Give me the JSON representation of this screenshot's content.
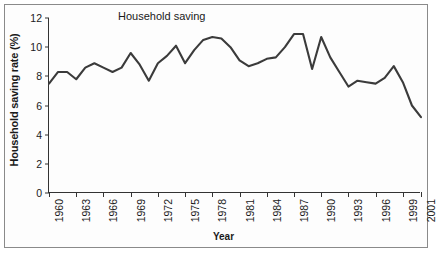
{
  "figure": {
    "border_color": "#8a8a8a",
    "background": "#ffffff"
  },
  "chart_data": {
    "type": "line",
    "title": "Household saving",
    "xlabel": "Year",
    "ylabel": "Household saving rate (%)",
    "grid": false,
    "legend": "none",
    "line_color": "#3b3b3b",
    "xlim": [
      1960,
      2001
    ],
    "ylim": [
      0,
      12
    ],
    "ytick_values": [
      0,
      2,
      4,
      6,
      8,
      10,
      12
    ],
    "ytick_labels": [
      "0",
      "2",
      "4",
      "6",
      "8",
      "10",
      "12"
    ],
    "xtick_values": [
      1960,
      1963,
      1966,
      1969,
      1972,
      1975,
      1978,
      1981,
      1984,
      1987,
      1990,
      1993,
      1996,
      1999,
      2001
    ],
    "xtick_labels": [
      "1960",
      "1963",
      "1966",
      "1969",
      "1972",
      "1975",
      "1978",
      "1981",
      "1984",
      "1987",
      "1990",
      "1993",
      "1996",
      "1999",
      "2001"
    ],
    "x": [
      1960,
      1961,
      1962,
      1963,
      1964,
      1965,
      1966,
      1967,
      1968,
      1969,
      1970,
      1971,
      1972,
      1973,
      1974,
      1975,
      1976,
      1977,
      1978,
      1979,
      1980,
      1981,
      1982,
      1983,
      1984,
      1985,
      1986,
      1987,
      1988,
      1989,
      1990,
      1991,
      1992,
      1993,
      1994,
      1995,
      1996,
      1997,
      1998,
      1999,
      2000,
      2001
    ],
    "values": [
      7.5,
      8.3,
      8.3,
      7.8,
      8.6,
      8.9,
      8.6,
      8.3,
      8.6,
      9.6,
      8.8,
      7.7,
      8.9,
      9.4,
      10.1,
      8.9,
      9.8,
      10.5,
      10.7,
      10.6,
      10.0,
      9.1,
      8.7,
      8.9,
      9.2,
      9.3,
      10.0,
      10.9,
      10.9,
      8.5,
      10.7,
      9.3,
      8.3,
      7.3,
      7.7,
      7.6,
      7.5,
      7.9,
      8.7,
      7.6,
      6.0,
      5.2
    ],
    "series": [
      {
        "name": "Household saving rate",
        "values": [
          7.5,
          8.3,
          8.3,
          7.8,
          8.6,
          8.9,
          8.6,
          8.3,
          8.6,
          9.6,
          8.8,
          7.7,
          8.9,
          9.4,
          10.1,
          8.9,
          9.8,
          10.5,
          10.7,
          10.6,
          10.0,
          9.1,
          8.7,
          8.9,
          9.2,
          9.3,
          10.0,
          10.9,
          10.9,
          8.5,
          10.7,
          9.3,
          8.3,
          7.3,
          7.7,
          7.6,
          7.5,
          7.9,
          8.7,
          7.6,
          6.0,
          5.2
        ]
      }
    ],
    "points": [
      [
        1960,
        7.5
      ],
      [
        1961,
        8.3
      ],
      [
        1962,
        8.3
      ],
      [
        1963,
        7.8
      ],
      [
        1964,
        8.6
      ],
      [
        1965,
        8.9
      ],
      [
        1966,
        8.6
      ],
      [
        1967,
        8.3
      ],
      [
        1968,
        8.6
      ],
      [
        1969,
        9.6
      ],
      [
        1970,
        8.8
      ],
      [
        1971,
        7.7
      ],
      [
        1972,
        8.9
      ],
      [
        1973,
        9.4
      ],
      [
        1974,
        10.1
      ],
      [
        1975,
        8.9
      ],
      [
        1976,
        9.8
      ],
      [
        1977,
        10.5
      ],
      [
        1978,
        10.7
      ],
      [
        1979,
        10.6
      ],
      [
        1980,
        10.0
      ],
      [
        1981,
        9.1
      ],
      [
        1982,
        8.7
      ],
      [
        1983,
        8.9
      ],
      [
        1984,
        9.2
      ],
      [
        1985,
        9.3
      ],
      [
        1986,
        10.0
      ],
      [
        1987,
        10.9
      ],
      [
        1988,
        10.9
      ],
      [
        1989,
        8.5
      ],
      [
        1990,
        10.7
      ],
      [
        1991,
        9.3
      ],
      [
        1992,
        8.3
      ],
      [
        1993,
        7.3
      ],
      [
        1994,
        7.7
      ],
      [
        1995,
        7.6
      ],
      [
        1996,
        7.5
      ],
      [
        1997,
        7.9
      ],
      [
        1998,
        8.7
      ],
      [
        1999,
        7.6
      ],
      [
        2000,
        6.0
      ],
      [
        2001,
        5.2
      ]
    ]
  }
}
